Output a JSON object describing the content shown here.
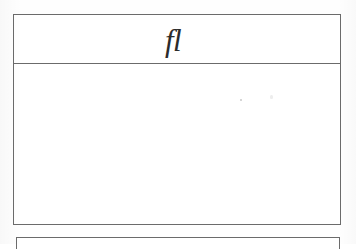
{
  "document": {
    "background_color": "#fefefe",
    "ink_color": "#2b2b2b",
    "rule_color": "#6b6b6b",
    "type": "scanned-document-fragment"
  },
  "tables": {
    "main": {
      "header": {
        "cell_text": "fl",
        "glyph_name": "fl-ligature-italic",
        "alignment": "center"
      },
      "body": {
        "cell_text": "",
        "rows": [
          {
            "cells": [
              ""
            ]
          }
        ]
      }
    },
    "next": {
      "caption": ""
    }
  },
  "artifacts": {
    "speck_a": "",
    "speck_b": ""
  }
}
